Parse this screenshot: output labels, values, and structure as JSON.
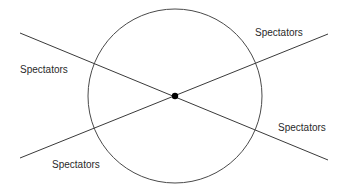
{
  "diagram": {
    "type": "spectator-sightlines",
    "background": "#ffffff",
    "stroke_color": "#4a4a4a",
    "circle": {
      "cx": 175,
      "cy": 96,
      "r": 87
    },
    "center_point": {
      "cx": 175,
      "cy": 96,
      "r": 3.2,
      "color": "#000000"
    },
    "lines": [
      {
        "x1": 20,
        "y1": 33,
        "x2": 328,
        "y2": 160
      },
      {
        "x1": 20,
        "y1": 158,
        "x2": 328,
        "y2": 34
      }
    ],
    "labels": [
      {
        "text": "Spectators",
        "x": 20,
        "y": 73,
        "position": "top-left"
      },
      {
        "text": "Spectators",
        "x": 255,
        "y": 36,
        "position": "top-right"
      },
      {
        "text": "Spectators",
        "x": 52,
        "y": 168,
        "position": "bottom-left"
      },
      {
        "text": "Spectators",
        "x": 278,
        "y": 131,
        "position": "bottom-right"
      }
    ]
  }
}
